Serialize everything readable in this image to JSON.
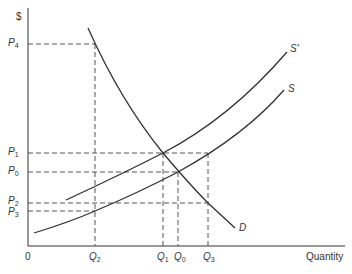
{
  "diagram": {
    "y_axis_label": "$",
    "x_axis_label": "Quantity",
    "origin_label": "0",
    "curves": {
      "demand": "D",
      "supply": "S",
      "supply_shifted": "S'"
    },
    "price_labels": [
      {
        "base": "P",
        "sub": "4"
      },
      {
        "base": "P",
        "sub": "1"
      },
      {
        "base": "P",
        "sub": "0"
      },
      {
        "base": "P",
        "sub": "2"
      },
      {
        "base": "P",
        "sub": "3"
      }
    ],
    "quantity_labels": [
      {
        "base": "Q",
        "sub": "2"
      },
      {
        "base": "Q",
        "sub": "1"
      },
      {
        "base": "Q",
        "sub": "0"
      },
      {
        "base": "Q",
        "sub": "3"
      }
    ],
    "colors": {
      "line": "#333333",
      "dashed": "#555555",
      "background": "#ffffff"
    }
  }
}
